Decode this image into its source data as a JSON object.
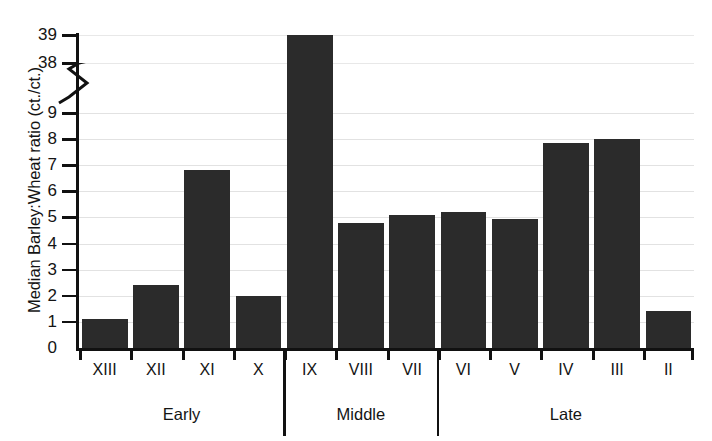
{
  "chart_data": {
    "type": "bar",
    "title": "",
    "xlabel": "",
    "ylabel": "Median Barley:Wheat ratio (ct./ct.)",
    "categories": [
      "XIII",
      "XII",
      "XI",
      "X",
      "IX",
      "VIII",
      "VII",
      "VI",
      "V",
      "IV",
      "III",
      "II"
    ],
    "values": [
      1.1,
      2.4,
      6.8,
      2.0,
      39.0,
      4.8,
      5.1,
      5.2,
      4.95,
      7.85,
      8.0,
      1.4
    ],
    "ylim": [
      0,
      39
    ],
    "y_axis_break": {
      "below": 9,
      "above": 38,
      "note": "broken axis between 9 and 38"
    },
    "yticks": [
      0,
      1,
      2,
      3,
      4,
      5,
      6,
      7,
      8,
      9,
      38,
      39
    ],
    "ytick_labels": [
      "0",
      "1",
      "2",
      "3",
      "4",
      "5",
      "6",
      "7",
      "8",
      "9",
      "38",
      "39"
    ],
    "gridlines": true,
    "legend": "none",
    "bar_color": "#2b2b2b",
    "groups": [
      {
        "label": "Early",
        "categories": [
          "XIII",
          "XII",
          "XI",
          "X"
        ]
      },
      {
        "label": "Middle",
        "categories": [
          "IX",
          "VIII",
          "VII"
        ]
      },
      {
        "label": "Late",
        "categories": [
          "VI",
          "V",
          "IV",
          "III",
          "II"
        ]
      }
    ]
  },
  "axis": {
    "y_title": "Median Barley:Wheat ratio (ct./ct.)",
    "ticks": [
      {
        "label": "39"
      },
      {
        "label": "38"
      },
      {
        "label": "9"
      },
      {
        "label": "8"
      },
      {
        "label": "7"
      },
      {
        "label": "6"
      },
      {
        "label": "5"
      },
      {
        "label": "4"
      },
      {
        "label": "3"
      },
      {
        "label": "2"
      },
      {
        "label": "1"
      },
      {
        "label": "0"
      }
    ]
  },
  "categories": [
    {
      "label": "XIII"
    },
    {
      "label": "XII"
    },
    {
      "label": "XI"
    },
    {
      "label": "X"
    },
    {
      "label": "IX"
    },
    {
      "label": "VIII"
    },
    {
      "label": "VII"
    },
    {
      "label": "VI"
    },
    {
      "label": "V"
    },
    {
      "label": "IV"
    },
    {
      "label": "III"
    },
    {
      "label": "II"
    }
  ],
  "groups": [
    {
      "label": "Early"
    },
    {
      "label": "Middle"
    },
    {
      "label": "Late"
    }
  ]
}
